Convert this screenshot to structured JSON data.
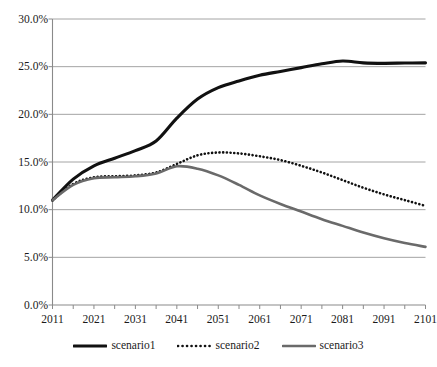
{
  "chart_data": {
    "type": "line",
    "title": "",
    "xlabel": "",
    "ylabel": "",
    "xlim": [
      2011,
      2101
    ],
    "ylim": [
      0,
      30
    ],
    "grid": "horizontal",
    "legend_position": "bottom",
    "y_tick_labels": [
      "30.0%",
      "25.0%",
      "20.0%",
      "15.0%",
      "10.0%",
      "5.0%",
      "0.0%"
    ],
    "y_tick_values": [
      30,
      25,
      20,
      15,
      10,
      5,
      0
    ],
    "x_tick_labels": [
      "2011",
      "2021",
      "2031",
      "2041",
      "2051",
      "2061",
      "2071",
      "2081",
      "2091",
      "2101"
    ],
    "x_tick_values": [
      2011,
      2021,
      2031,
      2041,
      2051,
      2061,
      2071,
      2081,
      2091,
      2101
    ],
    "x_minor_tick_interval": 5,
    "x": [
      2011,
      2016,
      2021,
      2026,
      2031,
      2036,
      2041,
      2046,
      2051,
      2056,
      2061,
      2066,
      2071,
      2076,
      2081,
      2086,
      2091,
      2096,
      2101
    ],
    "series": [
      {
        "name": "scenario1",
        "color": "#111111",
        "style": "solid",
        "width": 3.1,
        "values": [
          11.0,
          13.2,
          14.6,
          15.4,
          16.2,
          17.2,
          19.6,
          21.6,
          22.8,
          23.5,
          24.1,
          24.5,
          24.9,
          25.3,
          25.6,
          25.4,
          25.35,
          25.38,
          25.4
        ]
      },
      {
        "name": "scenario2",
        "color": "#111111",
        "style": "dotted",
        "width": 2.6,
        "values": [
          11.0,
          12.7,
          13.4,
          13.5,
          13.6,
          13.9,
          14.8,
          15.7,
          16.0,
          15.9,
          15.6,
          15.2,
          14.6,
          13.9,
          13.1,
          12.3,
          11.6,
          11.0,
          10.4
        ]
      },
      {
        "name": "scenario3",
        "color": "#6a6a6a",
        "style": "solid",
        "width": 2.6,
        "values": [
          11.0,
          12.6,
          13.3,
          13.4,
          13.5,
          13.8,
          14.55,
          14.3,
          13.6,
          12.6,
          11.5,
          10.6,
          9.8,
          9.0,
          8.3,
          7.6,
          7.0,
          6.5,
          6.1
        ]
      }
    ],
    "legend": [
      {
        "label": "scenario1",
        "color": "#111111",
        "style": "solid"
      },
      {
        "label": "scenario2",
        "color": "#111111",
        "style": "dotted"
      },
      {
        "label": "scenario3",
        "color": "#6a6a6a",
        "style": "solid"
      }
    ]
  }
}
